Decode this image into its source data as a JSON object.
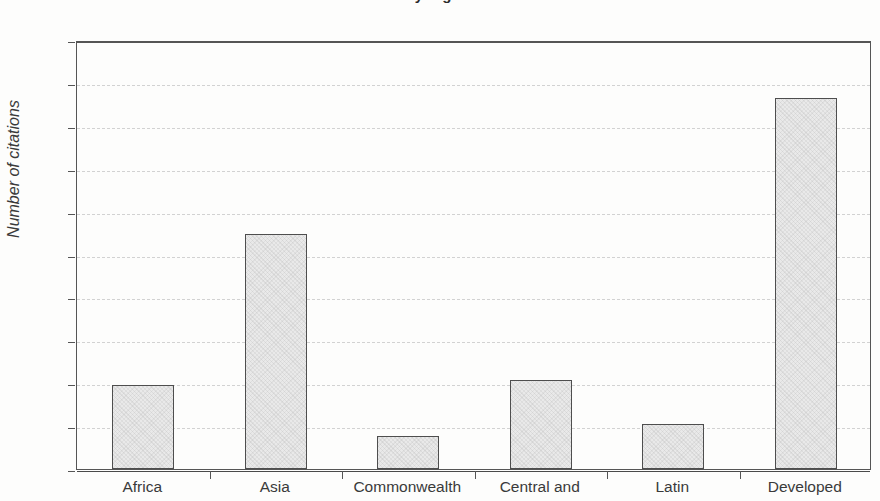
{
  "chart_data": {
    "type": "bar",
    "title": "by region",
    "title_note": "title is cropped off the top edge of the image; only letter descenders are visible",
    "xlabel": "",
    "ylabel": "Number of citations",
    "categories": [
      "Africa",
      "Asia",
      "Commonwealth",
      "Central and",
      "Latin",
      "Developed"
    ],
    "category_note": "each x label is a multi-line caption truncated by the bottom edge of the image; only the first line is visible",
    "values": [
      98,
      274,
      39,
      104,
      52,
      432
    ],
    "ylim": [
      0,
      500
    ],
    "ytick_values": [
      0,
      50,
      100,
      150,
      200,
      250,
      300,
      350,
      400,
      450,
      500
    ],
    "ytick_labels": [
      "0",
      "50",
      "100",
      "150",
      "200",
      "250",
      "300",
      "350",
      "400",
      "450",
      "500"
    ],
    "grid": true,
    "grid_style": "dashed-horizontal",
    "legend": null,
    "bar_fill_color": "#e9e9e9",
    "bar_edge_color": "#4e4e4e",
    "grid_color": "#d2d2d2",
    "axis_color": "#555555",
    "background_color": "#fdfdfc"
  }
}
